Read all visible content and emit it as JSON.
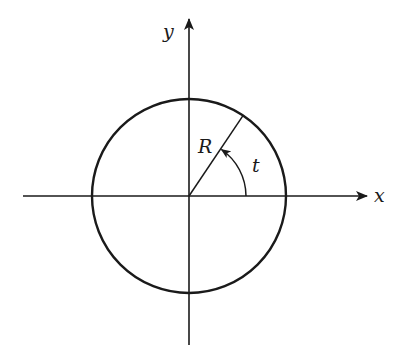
{
  "diagram": {
    "colors": {
      "stroke": "#1a1a1a",
      "background": "#ffffff"
    },
    "labels": {
      "x_axis": "x",
      "y_axis": "y",
      "radius": "R",
      "angle": "t"
    },
    "geometry": {
      "center": [
        189,
        196
      ],
      "circle_radius": 97,
      "radius_angle_deg": 56,
      "angle_arc_radius": 57,
      "x_axis_range": [
        23,
        368
      ],
      "y_axis_range": [
        345,
        18
      ]
    }
  }
}
